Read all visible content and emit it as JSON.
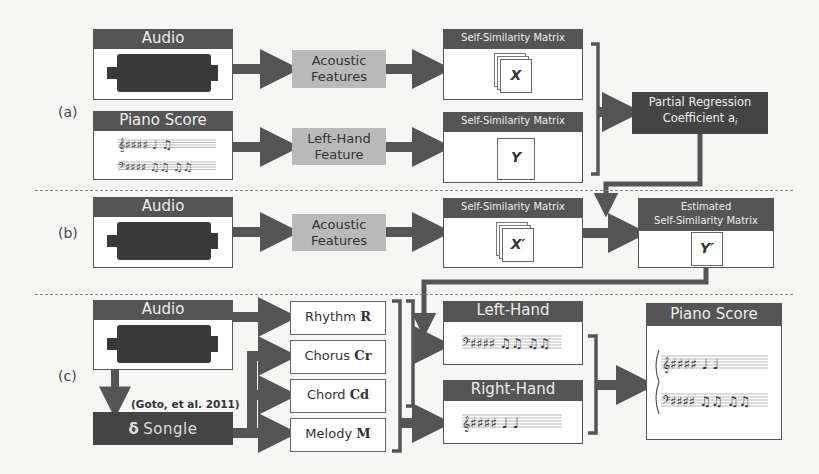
{
  "panels": {
    "a": {
      "label": "(a)",
      "audio_header": "Audio",
      "piano_score_header": "Piano Score",
      "acoustic_features": [
        "Acoustic",
        "Features"
      ],
      "left_hand_feature": [
        "Left-Hand",
        "Feature"
      ],
      "ssm_x_header": "Self-Similarity Matrix",
      "ssm_x_symbol": "X",
      "ssm_y_header": "Self-Similarity Matrix",
      "ssm_y_symbol": "Y",
      "partial_regression": [
        "Partial Regression",
        "Coefficient a"
      ],
      "partial_regression_subscript": "i"
    },
    "b": {
      "label": "(b)",
      "audio_header": "Audio",
      "acoustic_features": [
        "Acoustic",
        "Features"
      ],
      "ssm_x_header": "Self-Similarity Matrix",
      "ssm_x_symbol": "X′",
      "estimated_ssm_header": [
        "Estimated",
        "Self-Similarity Matrix"
      ],
      "estimated_ssm_symbol": "Y′"
    },
    "c": {
      "label": "(c)",
      "audio_header": "Audio",
      "songle_ref": "(Goto, et al. 2011)",
      "songle_logo": "Songle",
      "songle_icon": "δ",
      "features": [
        {
          "name": "Rhythm",
          "symbol": "R"
        },
        {
          "name": "Chorus",
          "symbol": "Cr"
        },
        {
          "name": "Chord",
          "symbol": "Cd"
        },
        {
          "name": "Melody",
          "symbol": "M"
        }
      ],
      "left_hand_header": "Left-Hand",
      "right_hand_header": "Right-Hand",
      "piano_score_header": "Piano Score"
    }
  },
  "colors": {
    "dark_header": "#555555",
    "grey_box": "#b9b9b9",
    "dark_box": "#444444",
    "arrow": "#555555",
    "background": "#f6f6f4"
  }
}
